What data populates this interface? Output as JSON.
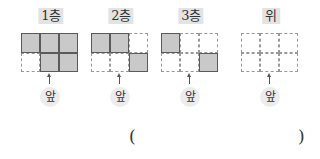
{
  "floors": [
    {
      "label": "1층",
      "front_label": "앞",
      "cells": [
        [
          1,
          1,
          1
        ],
        [
          0,
          1,
          1
        ]
      ]
    },
    {
      "label": "2층",
      "front_label": "앞",
      "cells": [
        [
          1,
          1,
          0
        ],
        [
          0,
          0,
          1
        ]
      ]
    },
    {
      "label": "3층",
      "front_label": "앞",
      "cells": [
        [
          1,
          0,
          0
        ],
        [
          0,
          0,
          1
        ]
      ]
    },
    {
      "label": "위",
      "front_label": "앞",
      "cells": [
        [
          0,
          0,
          0
        ],
        [
          0,
          0,
          0
        ]
      ]
    }
  ],
  "answer": {
    "open": "(",
    "close": ")",
    "value": ""
  },
  "colors": {
    "filled": "#c9c9c9",
    "border": "#5a5a5a",
    "badge": "#e3e3e3"
  }
}
